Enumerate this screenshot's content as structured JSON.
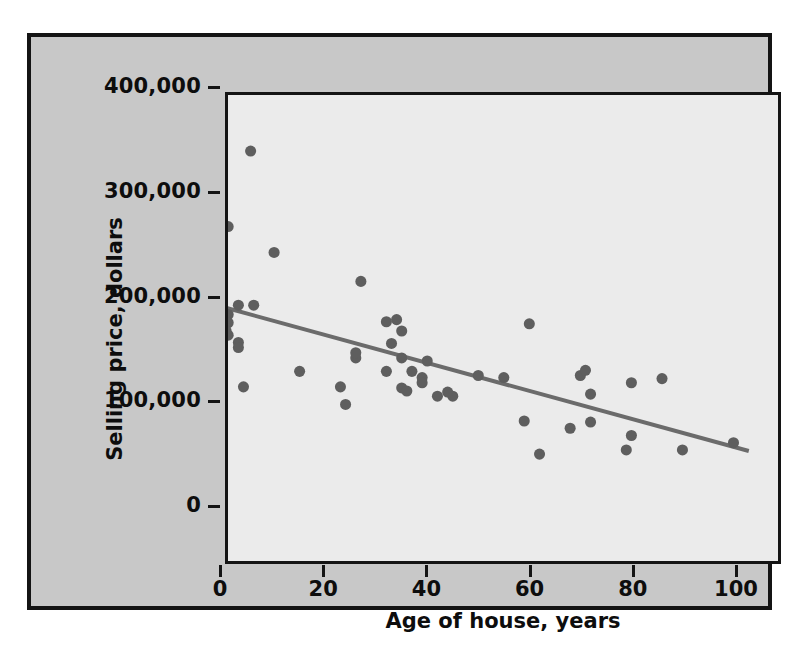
{
  "chart_data": {
    "type": "scatter",
    "title": "",
    "xlabel": "Age of house, years",
    "ylabel": "Selling price, dollars",
    "xlim": [
      -5,
      105
    ],
    "ylim": [
      0,
      420000
    ],
    "xticks": [
      0,
      20,
      40,
      60,
      80,
      100
    ],
    "xtick_labels": [
      "0",
      "20",
      "40",
      "60",
      "80",
      "100"
    ],
    "yticks": [
      0,
      100000,
      200000,
      300000,
      400000
    ],
    "ytick_labels": [
      "0",
      "100,000",
      "200,000",
      "300,000",
      "400,000"
    ],
    "grid": false,
    "legend": null,
    "marker_color": "#5e5e5e",
    "trendline_color": "#6b6b6b",
    "plot_background": "#ebebeb",
    "panel_background": "#c8c8c8",
    "frame_color": "#141414",
    "trendline": {
      "label": "least-squares regression line",
      "x": [
        -5,
        103
      ],
      "y": [
        197000,
        51000
      ],
      "slope": -1352,
      "intercept": 190240
    },
    "x": [
      5.4,
      1.0,
      10.0,
      27.0,
      3.0,
      6.0,
      1.0,
      1.0,
      0.6,
      1.0,
      3.0,
      3.0,
      4.0,
      15.0,
      23.0,
      24.0,
      26.0,
      26.0,
      32.0,
      34.0,
      35.0,
      33.0,
      35.0,
      40.0,
      32.0,
      37.0,
      39.0,
      39.0,
      35.0,
      36.0,
      42.0,
      45.0,
      44.0,
      50.0,
      55.0,
      60.0,
      59.0,
      62.0,
      70.0,
      72.0,
      72.0,
      68.0,
      71.0,
      80.0,
      80.0,
      79.0,
      86.0,
      90.0,
      100.0
    ],
    "y": [
      341000,
      268000,
      243000,
      215000,
      192000,
      192000,
      183000,
      175000,
      167000,
      163000,
      156000,
      151000,
      113000,
      128000,
      113000,
      96000,
      141000,
      146000,
      176000,
      178000,
      167000,
      155000,
      141000,
      138000,
      128000,
      128000,
      122000,
      117000,
      112000,
      109000,
      104000,
      104000,
      108000,
      124000,
      122000,
      174000,
      80000,
      48000,
      124000,
      106000,
      79000,
      73000,
      129000,
      117000,
      66000,
      52000,
      121000,
      52000,
      59000
    ],
    "n_points": 49
  }
}
